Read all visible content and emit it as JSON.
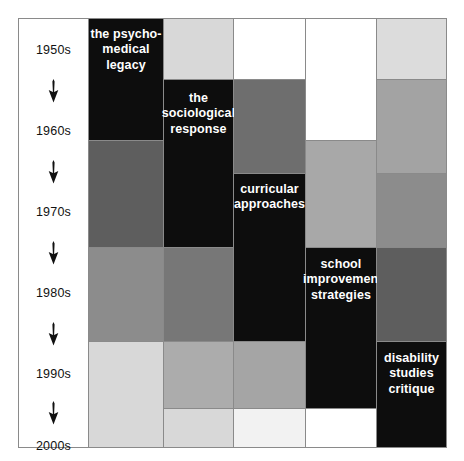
{
  "figure": {
    "type": "stratified-timeline-matrix",
    "background": "#ffffff",
    "frame_color": "#8a8a8a"
  },
  "timeline": {
    "name": "decades-timeline",
    "decades": [
      {
        "label": "1950s",
        "top": 24
      },
      {
        "label": "1960s",
        "top": 105
      },
      {
        "label": "1970s",
        "top": 186
      },
      {
        "label": "1980s",
        "top": 267
      },
      {
        "label": "1990s",
        "top": 348
      },
      {
        "label": "2000s",
        "top": 420
      }
    ],
    "arrows": [
      {
        "name": "arrow-1950s-1960s",
        "top": 60
      },
      {
        "name": "arrow-1960s-1970s",
        "top": 141
      },
      {
        "name": "arrow-1970s-1980s",
        "top": 222
      },
      {
        "name": "arrow-1980s-1990s",
        "top": 303
      },
      {
        "name": "arrow-1990s-2000s",
        "top": 382
      }
    ]
  },
  "palette": {
    "black": "#0d0d0d",
    "dark_gray": "#5e5e5e",
    "mid_gray": "#8c8c8c",
    "light_gray": "#b5b5b5",
    "pale_gray": "#d8d8d8",
    "very_pale_gray": "#e8e8e8",
    "white": "#ffffff"
  },
  "columns": [
    {
      "name": "column-psycho-medical-legacy",
      "left": 70,
      "width": 75,
      "cells": [
        {
          "name": "cell-psycho-medical-legacy",
          "top": 0,
          "height": 122,
          "color": "#0d0d0d",
          "label": {
            "lines": [
              "the psycho-",
              "medical",
              "legacy"
            ],
            "top": 8
          }
        },
        {
          "name": "cell-c1-r2",
          "top": 122,
          "height": 107,
          "color": "#5e5e5e",
          "label": null
        },
        {
          "name": "cell-c1-r3",
          "top": 229,
          "height": 94,
          "color": "#8c8c8c",
          "label": null
        },
        {
          "name": "cell-c1-r4",
          "top": 323,
          "height": 106,
          "color": "#d8d8d8",
          "label": null
        }
      ]
    },
    {
      "name": "column-sociological-response",
      "left": 145,
      "width": 70,
      "cells": [
        {
          "name": "cell-c2-r1",
          "top": 0,
          "height": 61,
          "color": "#d8d8d8",
          "label": null
        },
        {
          "name": "cell-sociological-response",
          "top": 61,
          "height": 168,
          "color": "#0d0d0d",
          "label": {
            "lines": [
              "the",
              "sociological",
              "response"
            ],
            "top": 11
          }
        },
        {
          "name": "cell-c2-r3",
          "top": 229,
          "height": 94,
          "color": "#777777",
          "label": null
        },
        {
          "name": "cell-c2-r4",
          "top": 323,
          "height": 67,
          "color": "#acacac",
          "label": null
        },
        {
          "name": "cell-c2-r5",
          "top": 390,
          "height": 39,
          "color": "#d8d8d8",
          "label": null
        }
      ]
    },
    {
      "name": "column-curricular-approaches",
      "left": 215,
      "width": 72,
      "cells": [
        {
          "name": "cell-c3-r1",
          "top": 0,
          "height": 61,
          "color": "#ffffff",
          "label": null
        },
        {
          "name": "cell-c3-r2",
          "top": 61,
          "height": 94,
          "color": "#6e6e6e",
          "label": null
        },
        {
          "name": "cell-curricular-approaches",
          "top": 155,
          "height": 168,
          "color": "#0d0d0d",
          "label": {
            "lines": [
              "curricular",
              "approaches"
            ],
            "top": 8
          }
        },
        {
          "name": "cell-c3-r4",
          "top": 323,
          "height": 67,
          "color": "#a5a5a5",
          "label": null
        },
        {
          "name": "cell-c3-r5",
          "top": 390,
          "height": 39,
          "color": "#f2f2f2",
          "label": null
        }
      ]
    },
    {
      "name": "column-school-improvement-strategies",
      "left": 287,
      "width": 71,
      "cells": [
        {
          "name": "cell-c4-r1",
          "top": 0,
          "height": 122,
          "color": "#ffffff",
          "label": null
        },
        {
          "name": "cell-c4-r2",
          "top": 122,
          "height": 107,
          "color": "#a8a8a8",
          "label": null
        },
        {
          "name": "cell-school-improvement-strategies",
          "top": 229,
          "height": 161,
          "color": "#0d0d0d",
          "label": {
            "lines": [
              "school",
              "improvement",
              "strategies"
            ],
            "top": 9
          }
        },
        {
          "name": "cell-c4-r4",
          "top": 390,
          "height": 39,
          "color": "#ffffff",
          "label": null
        }
      ]
    },
    {
      "name": "column-disability-studies-critique",
      "left": 358,
      "width": 70,
      "cells": [
        {
          "name": "cell-c5-r1",
          "top": 0,
          "height": 61,
          "color": "#dcdcdc",
          "label": null
        },
        {
          "name": "cell-c5-r2",
          "top": 61,
          "height": 94,
          "color": "#a3a3a3",
          "label": null
        },
        {
          "name": "cell-c5-r3",
          "top": 155,
          "height": 74,
          "color": "#8c8c8c",
          "label": null
        },
        {
          "name": "cell-c5-r4",
          "top": 229,
          "height": 94,
          "color": "#5e5e5e",
          "label": null
        },
        {
          "name": "cell-disability-studies-critique",
          "top": 323,
          "height": 106,
          "color": "#0d0d0d",
          "label": {
            "lines": [
              "disability",
              "studies",
              "critique"
            ],
            "top": 9
          }
        }
      ]
    }
  ]
}
